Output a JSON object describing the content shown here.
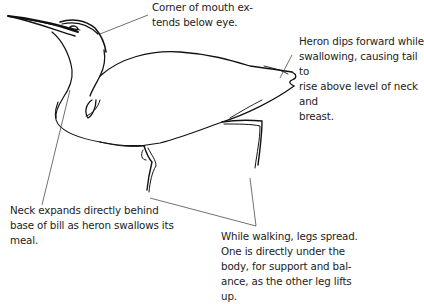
{
  "figure": {
    "line_color": "#111111",
    "leader_color": "#333333"
  },
  "annotations": [
    {
      "id": "mouth",
      "text": "Corner of mouth ex-\ntends below eye."
    },
    {
      "id": "tail",
      "text": "Heron dips forward while\nswallowing, causing tail to\nrise above level of neck and\nbreast."
    },
    {
      "id": "neck",
      "text": "Neck expands directly behind\nbase of bill as heron swallows its\nmeal."
    },
    {
      "id": "legs",
      "text": "While walking, legs spread.\nOne is directly under the\nbody, for support and bal-\nance, as the other leg lifts\nup."
    }
  ]
}
